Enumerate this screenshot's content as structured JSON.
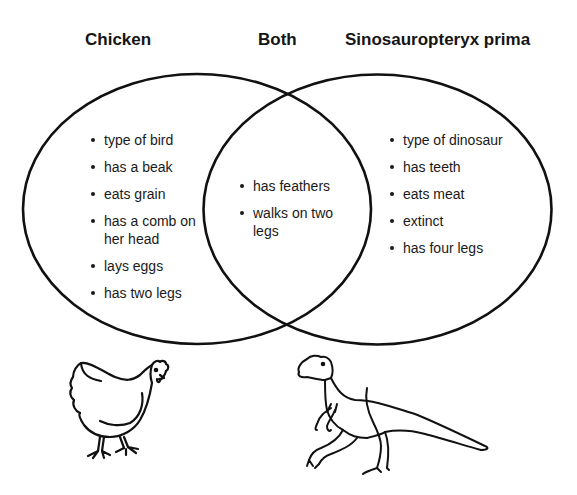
{
  "diagram": {
    "type": "venn",
    "stroke_color": "#111111",
    "background": "#ffffff"
  },
  "headings": {
    "left": "Chicken",
    "middle": "Both",
    "right": "Sinosauropteryx prima"
  },
  "sets": {
    "left": {
      "name": "Chicken",
      "items": [
        "type of bird",
        "has a beak",
        "eats grain",
        "has a comb on her head",
        "lays eggs",
        "has two legs"
      ]
    },
    "both": {
      "name": "Both",
      "items": [
        "has feathers",
        "walks on two legs"
      ]
    },
    "right": {
      "name": "Sinosauropteryx prima",
      "items": [
        "type of dinosaur",
        "has teeth",
        "eats meat",
        "extinct",
        "has four legs"
      ]
    }
  },
  "illustrations": {
    "left": "chicken-drawing",
    "right": "dinosaur-drawing"
  }
}
